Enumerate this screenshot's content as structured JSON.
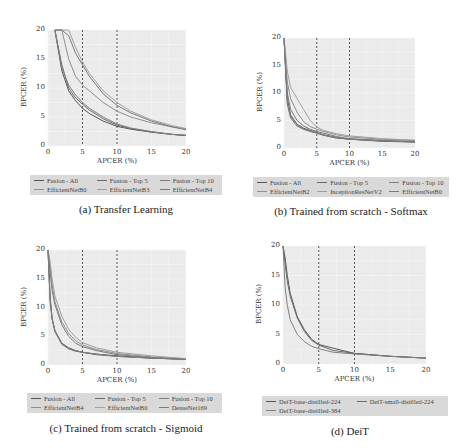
{
  "figure": {
    "panels": [
      {
        "id": "a",
        "caption": "(a) Transfer Learning",
        "xlabel": "APCER (%)",
        "ylabel": "BPCER (%)",
        "xticks": [
          "0",
          "5",
          "10",
          "15",
          "20"
        ],
        "yticks": [
          "0",
          "5",
          "10",
          "15",
          "20"
        ],
        "legend": [
          "Fusion - All",
          "Fusion - Top 5",
          "Fusion - Top 10",
          "EfficientNetB0",
          "EfficientNetB3",
          "EfficientNetB4"
        ]
      },
      {
        "id": "b",
        "caption": "(b) Trained from scratch - Softmax",
        "xlabel": "APCER (%)",
        "ylabel": "BPCER (%)",
        "xticks": [
          "0",
          "5",
          "10",
          "15",
          "20"
        ],
        "yticks": [
          "0",
          "5",
          "10",
          "15",
          "20"
        ],
        "legend": [
          "Fusion - All",
          "Fusion - Top 5",
          "Fusion - Top 10",
          "EfficientNetB2",
          "InceptionResNetV2",
          "EfficientNetB0"
        ]
      },
      {
        "id": "c",
        "caption": "(c) Trained from scratch - Sigmoid",
        "xlabel": "APCER (%)",
        "ylabel": "BPCER (%)",
        "xticks": [
          "0",
          "5",
          "10",
          "15",
          "20"
        ],
        "yticks": [
          "0",
          "5",
          "10",
          "15",
          "20"
        ],
        "legend": [
          "Fusion - All",
          "Fusion - Top 5",
          "Fusion - Top 10",
          "EfficientNetB4",
          "EfficientNetB0",
          "DenseNet169"
        ]
      },
      {
        "id": "d",
        "caption": "(d) DeiT",
        "xlabel": "APCER (%)",
        "ylabel": "BPCER (%)",
        "xticks": [
          "0",
          "5",
          "10",
          "15",
          "20"
        ],
        "yticks": [
          "0",
          "5",
          "10",
          "15",
          "20"
        ],
        "legend": [
          "DeiT-base-distilled-224",
          "DeiT-small-distilled-224",
          "DeiT-base-distilled-384"
        ]
      }
    ]
  },
  "chart_data": [
    {
      "type": "line",
      "title": "(a) Transfer Learning",
      "xlabel": "APCER (%)",
      "ylabel": "BPCER (%)",
      "xlim": [
        0,
        20
      ],
      "ylim": [
        0,
        20
      ],
      "grid": true,
      "legend_position": "below",
      "reference_lines_x": [
        5,
        10
      ],
      "x": [
        1,
        2,
        3,
        4,
        5,
        6,
        8,
        10,
        12,
        15,
        18,
        20
      ],
      "series": [
        {
          "name": "Fusion - All",
          "values": [
            20,
            13,
            9.5,
            7.8,
            6.5,
            5.6,
            4.3,
            3.4,
            2.9,
            2.4,
            2.0,
            1.8
          ]
        },
        {
          "name": "Fusion - Top 5",
          "values": [
            20,
            14,
            10,
            8.3,
            7.2,
            6.2,
            4.7,
            3.6,
            3.0,
            2.4,
            2.0,
            1.8
          ]
        },
        {
          "name": "Fusion - Top 10",
          "values": [
            20,
            13.5,
            10.5,
            8.8,
            7.5,
            6.5,
            5.0,
            3.8,
            3.1,
            2.5,
            2.0,
            1.9
          ]
        },
        {
          "name": "EfficientNetB0",
          "values": [
            20,
            20,
            15,
            12,
            10.5,
            9.5,
            7.5,
            6.0,
            5.0,
            4.0,
            3.3,
            3.0
          ]
        },
        {
          "name": "EfficientNetB3",
          "values": [
            20,
            20,
            20,
            17,
            14.5,
            12.5,
            9.5,
            7.5,
            6.0,
            4.5,
            3.5,
            3.0
          ]
        },
        {
          "name": "EfficientNetB4",
          "values": [
            20,
            20,
            19,
            16,
            14,
            12,
            9,
            7.0,
            5.7,
            4.3,
            3.3,
            2.8
          ]
        }
      ]
    },
    {
      "type": "line",
      "title": "(b) Trained from scratch - Softmax",
      "xlabel": "APCER (%)",
      "ylabel": "BPCER (%)",
      "xlim": [
        0,
        20
      ],
      "ylim": [
        0,
        20
      ],
      "grid": true,
      "legend_position": "below",
      "reference_lines_x": [
        5,
        10
      ],
      "x": [
        0,
        0.5,
        1,
        2,
        3,
        4,
        5,
        6,
        8,
        10,
        15,
        20
      ],
      "series": [
        {
          "name": "Fusion - All",
          "values": [
            20,
            9,
            6,
            4.3,
            3.6,
            3.2,
            2.8,
            2.4,
            1.9,
            1.6,
            1.3,
            1.1
          ]
        },
        {
          "name": "Fusion - Top 5",
          "values": [
            20,
            8,
            5.5,
            4.0,
            3.4,
            3.0,
            2.7,
            2.3,
            1.8,
            1.6,
            1.2,
            1.1
          ]
        },
        {
          "name": "Fusion - Top 10",
          "values": [
            20,
            8.5,
            5.8,
            4.2,
            3.5,
            3.1,
            2.8,
            2.4,
            1.9,
            1.6,
            1.3,
            1.1
          ]
        },
        {
          "name": "EfficientNetB2",
          "values": [
            20,
            12,
            9,
            6.5,
            4.8,
            3.9,
            3.4,
            3.0,
            2.4,
            2.0,
            1.6,
            1.4
          ]
        },
        {
          "name": "InceptionResNetV2",
          "values": [
            20,
            14,
            11,
            9,
            7,
            5.0,
            3.8,
            3.2,
            2.6,
            2.2,
            1.7,
            1.4
          ]
        },
        {
          "name": "EfficientNetB0",
          "values": [
            20,
            10,
            7,
            5.0,
            4.0,
            3.4,
            3.0,
            2.7,
            2.1,
            1.7,
            1.4,
            1.2
          ]
        }
      ]
    },
    {
      "type": "line",
      "title": "(c) Trained from scratch - Sigmoid",
      "xlabel": "APCER (%)",
      "ylabel": "BPCER (%)",
      "xlim": [
        0,
        20
      ],
      "ylim": [
        0,
        20
      ],
      "grid": true,
      "legend_position": "below",
      "reference_lines_x": [
        5,
        10
      ],
      "x": [
        0,
        0.3,
        0.6,
        1,
        2,
        3,
        4,
        5,
        7,
        10,
        15,
        20
      ],
      "series": [
        {
          "name": "Fusion - All",
          "values": [
            20,
            12,
            8,
            6,
            3.8,
            3.0,
            2.5,
            2.2,
            1.9,
            1.6,
            1.2,
            1.0
          ]
        },
        {
          "name": "Fusion - Top 5",
          "values": [
            20,
            11,
            8,
            5.8,
            3.6,
            2.8,
            2.4,
            2.2,
            1.8,
            1.5,
            1.2,
            1.0
          ]
        },
        {
          "name": "Fusion - Top 10",
          "values": [
            20,
            11.5,
            8.2,
            6,
            3.7,
            2.9,
            2.5,
            2.2,
            1.9,
            1.5,
            1.2,
            1.0
          ]
        },
        {
          "name": "EfficientNetB4",
          "values": [
            20,
            17,
            14,
            11,
            7.5,
            5.5,
            4.2,
            3.5,
            2.7,
            2.0,
            1.4,
            1.1
          ]
        },
        {
          "name": "EfficientNetB0",
          "values": [
            20,
            18,
            15,
            12,
            8.5,
            6.2,
            4.8,
            3.9,
            3.0,
            2.2,
            1.6,
            1.1
          ]
        },
        {
          "name": "DenseNet169",
          "values": [
            20,
            16,
            13,
            10.5,
            7,
            5.0,
            3.8,
            3.2,
            2.5,
            1.8,
            1.3,
            1.0
          ]
        }
      ]
    },
    {
      "type": "line",
      "title": "(d) DeiT",
      "xlabel": "APCER (%)",
      "ylabel": "BPCER (%)",
      "xlim": [
        0,
        20
      ],
      "ylim": [
        0,
        20
      ],
      "grid": true,
      "legend_position": "below",
      "reference_lines_x": [
        5,
        10
      ],
      "x": [
        0,
        0.3,
        0.6,
        1,
        2,
        3,
        4,
        5,
        7,
        10,
        15,
        20
      ],
      "series": [
        {
          "name": "DeiT-base-distilled-224",
          "values": [
            20,
            18,
            15,
            12,
            8,
            5.8,
            4.2,
            3.3,
            2.7,
            1.8,
            1.3,
            1.0
          ]
        },
        {
          "name": "DeiT-small-distilled-224",
          "values": [
            20,
            17,
            14,
            11.5,
            7.8,
            5.5,
            4.0,
            3.2,
            2.3,
            1.8,
            1.3,
            1.0
          ]
        },
        {
          "name": "DeiT-base-distilled-384",
          "values": [
            20,
            13,
            10,
            7.5,
            5.0,
            3.8,
            3.0,
            2.6,
            2.0,
            1.7,
            1.3,
            1.0
          ]
        }
      ]
    }
  ]
}
